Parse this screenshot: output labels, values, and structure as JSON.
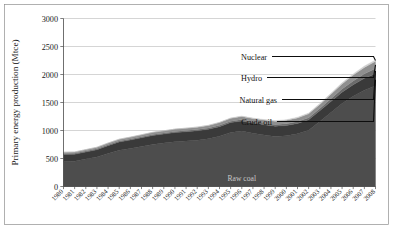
{
  "chart_data": {
    "type": "area",
    "title": "",
    "xlabel": "",
    "ylabel": "Primary energy production (Mtce)",
    "ylim": [
      0,
      3000
    ],
    "yticks": [
      0,
      500,
      1000,
      1500,
      2000,
      2500,
      3000
    ],
    "grid": true,
    "legend_position": "inline-callouts",
    "stacked": true,
    "categories": [
      "1980",
      "1981",
      "1982",
      "1983",
      "1984",
      "1985",
      "1986",
      "1987",
      "1988",
      "1989",
      "1990",
      "1991",
      "1992",
      "1993",
      "1994",
      "1995",
      "1996",
      "1997",
      "1998",
      "1999",
      "2000",
      "2001",
      "2002",
      "2003",
      "2004",
      "2005",
      "2006",
      "2007",
      "2008"
    ],
    "series": [
      {
        "name": "Raw coal",
        "color": "#4d4d4d",
        "values": [
          441,
          452,
          491,
          528,
          590,
          649,
          679,
          715,
          752,
          776,
          800,
          812,
          827,
          851,
          897,
          965,
          990,
          950,
          920,
          895,
          905,
          940,
          1005,
          1160,
          1320,
          1480,
          1610,
          1720,
          1800
        ]
      },
      {
        "name": "Crude oil",
        "color": "#3a3a3a",
        "values": [
          131,
          124,
          125,
          129,
          138,
          146,
          150,
          154,
          158,
          160,
          163,
          166,
          168,
          170,
          172,
          176,
          180,
          181,
          182,
          183,
          184,
          186,
          188,
          192,
          198,
          204,
          208,
          212,
          215
        ]
      },
      {
        "name": "Natural gas",
        "color": "#6b6b6b",
        "values": [
          19,
          17,
          16,
          16,
          17,
          17,
          18,
          18,
          19,
          19,
          20,
          21,
          21,
          22,
          23,
          24,
          25,
          26,
          27,
          28,
          30,
          33,
          36,
          42,
          50,
          58,
          68,
          80,
          92
        ]
      },
      {
        "name": "Hydro",
        "color": "#8f8f8f",
        "values": [
          22,
          24,
          27,
          29,
          31,
          33,
          35,
          37,
          38,
          40,
          42,
          42,
          44,
          47,
          50,
          53,
          56,
          57,
          58,
          60,
          63,
          66,
          68,
          72,
          80,
          90,
          103,
          115,
          128
        ]
      },
      {
        "name": "Nuclear",
        "color": "#cfcfcf",
        "values": [
          0,
          0,
          0,
          0,
          0,
          0,
          0,
          0,
          0,
          0,
          0,
          1,
          3,
          4,
          5,
          6,
          7,
          8,
          9,
          10,
          11,
          13,
          14,
          16,
          18,
          20,
          22,
          24,
          26
        ]
      }
    ],
    "callouts": [
      {
        "label": "Nuclear",
        "series": "Nuclear"
      },
      {
        "label": "Hydro",
        "series": "Hydro"
      },
      {
        "label": "Natural gas",
        "series": "Natural gas"
      },
      {
        "label": "Crude oil",
        "series": "Crude oil"
      }
    ],
    "inline_labels": [
      {
        "label": "Raw coal",
        "series": "Raw coal"
      }
    ]
  }
}
